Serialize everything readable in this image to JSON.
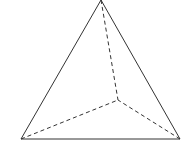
{
  "figure": {
    "type": "tetrahedron",
    "stroke_color": "#333333",
    "vertices": {
      "apex": [
        101,
        0
      ],
      "bottom_left": [
        21,
        139
      ],
      "bottom_right": [
        180,
        139
      ],
      "back": [
        118,
        100
      ]
    },
    "solid_edges": [
      [
        "apex",
        "bottom_left"
      ],
      [
        "apex",
        "bottom_right"
      ],
      [
        "bottom_left",
        "bottom_right"
      ]
    ],
    "dashed_edges": [
      [
        "apex",
        "back"
      ],
      [
        "bottom_left",
        "back"
      ],
      [
        "bottom_right",
        "back"
      ]
    ]
  }
}
